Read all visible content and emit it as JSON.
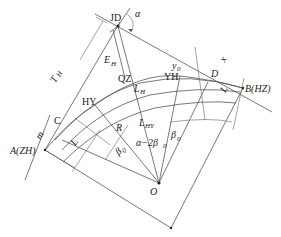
{
  "labels": {
    "jd": "JD",
    "alpha": "α",
    "e_h": "E",
    "e_h_sub": "H",
    "t_h": "T",
    "t_h_sub": "H",
    "qz": "QZ",
    "l_h": "L",
    "l_h_sub": "H",
    "hy": "HY",
    "yh": "YH",
    "y0": "y",
    "y0_sub": "0",
    "x0": "x",
    "x0_sub": "0",
    "d": "D",
    "b_hz": "B(HZ)",
    "a_zh": "A(ZH)",
    "c": "C",
    "m": "m",
    "p": "p",
    "ls_left": "L",
    "ls_left_sub": "s",
    "ls_right": "L",
    "ls_right_sub": "s",
    "r": "R",
    "beta0_left": "β",
    "beta0_left_sub": "0",
    "beta0_right": "β",
    "beta0_right_sub": "0",
    "lhy": "L",
    "lhy_sub": "HY",
    "alpha_minus": "α−2β",
    "alpha_minus_sub": "0",
    "o": "O"
  }
}
